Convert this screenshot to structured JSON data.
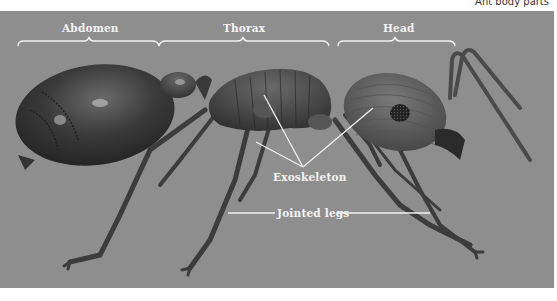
{
  "figure": {
    "caption": "Ant body parts",
    "background_color": "#8e8e8e",
    "label_color": "#f4f4f4"
  },
  "regions": [
    {
      "label": "Abdomen",
      "bracket": {
        "x1": 18,
        "x2": 158
      }
    },
    {
      "label": "Thorax",
      "bracket": {
        "x1": 160,
        "x2": 328
      }
    },
    {
      "label": "Head",
      "bracket": {
        "x1": 338,
        "x2": 455
      }
    }
  ],
  "callouts": [
    {
      "label": "Exoskeleton",
      "pointers": 3
    },
    {
      "label": "Jointed legs",
      "pointers": 2
    }
  ],
  "illustration": {
    "subject": "ant",
    "parts": [
      "abdomen",
      "petiole",
      "thorax",
      "head",
      "compound-eye",
      "mandible",
      "antennae",
      "legs"
    ]
  }
}
